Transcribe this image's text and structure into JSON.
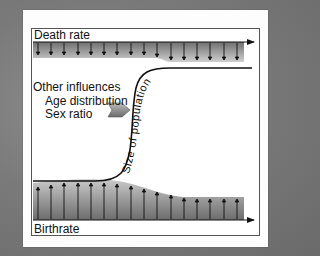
{
  "diagram": {
    "top_band_label": "Death rate",
    "bottom_band_label": "Birthrate",
    "influences": {
      "heading": "Other influences",
      "items": [
        "Age distribution",
        "Sex ratio"
      ]
    },
    "curve_label": "Size of population",
    "colors": {
      "background": "#7a7a7a",
      "card": "#fdfdfd",
      "band_dark": "#6e6e6e",
      "band_light": "#c8c8c8",
      "line": "#111111",
      "influence_arrow": "#8a8a8a"
    },
    "death_rate_arrows": 16,
    "birthrate_arrows": 16
  }
}
